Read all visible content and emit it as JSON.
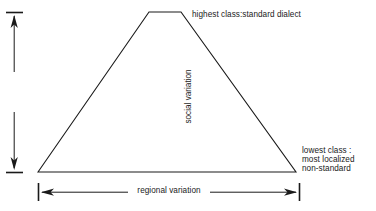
{
  "diagram": {
    "background_color": "#ffffff",
    "line_color": "#1a1a1a",
    "labels": {
      "apex": "highest class:standard dialect",
      "base_line_1": "lowest class :",
      "base_line_2": "most localized",
      "base_line_3": "non-standard",
      "y_axis": "social variation",
      "x_axis": "regional variation"
    },
    "shape": {
      "type": "trapezoid",
      "top_left_x": 149,
      "top_right_x": 181,
      "top_y": 12,
      "bottom_left_x": 38,
      "bottom_right_x": 296,
      "bottom_y": 172
    },
    "axes": {
      "vertical": {
        "x": 14,
        "top_y": 12,
        "bottom_y": 173,
        "arrowheads": "both",
        "end_caps": "both"
      },
      "horizontal": {
        "y": 192,
        "left_x": 38,
        "right_x": 299,
        "arrowheads": "both",
        "end_caps": "both"
      }
    }
  }
}
